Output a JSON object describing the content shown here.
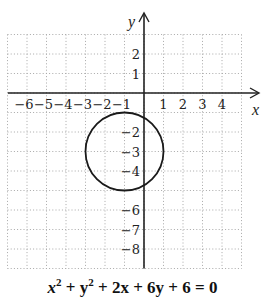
{
  "chart_data": {
    "type": "line",
    "title": "",
    "equation": "x^2 + y^2 + 2x + 6y + 6 = 0",
    "xlabel": "x",
    "ylabel": "y",
    "xlim": [
      -7,
      5
    ],
    "ylim": [
      -9,
      3
    ],
    "grid": true,
    "grid_style": "dotted",
    "x_ticks": [
      -6,
      -5,
      -4,
      -3,
      -2,
      -1,
      1,
      2,
      3,
      4
    ],
    "x_tick_labels": [
      "−6",
      "−5",
      "−4",
      "−3",
      "−2",
      "−1",
      "1",
      "2",
      "3",
      "4"
    ],
    "y_ticks": [
      2,
      1,
      -2,
      -3,
      -4,
      -6,
      -7,
      -8
    ],
    "y_tick_labels": [
      "2",
      "1",
      "−2",
      "−3",
      "−4",
      "−6",
      "−7",
      "−8"
    ],
    "series": [
      {
        "name": "circle",
        "shape": "circle",
        "center": [
          -1,
          -3
        ],
        "radius": 2
      }
    ]
  },
  "caption": {
    "x": "x",
    "exp1": "2",
    "plus_y": " + y",
    "exp2": "2",
    "rest": " + 2x + 6y + 6 = 0"
  },
  "colors": {
    "axis": "#222222",
    "grid": "#a8a8a8",
    "curve": "#1a1a1a"
  }
}
